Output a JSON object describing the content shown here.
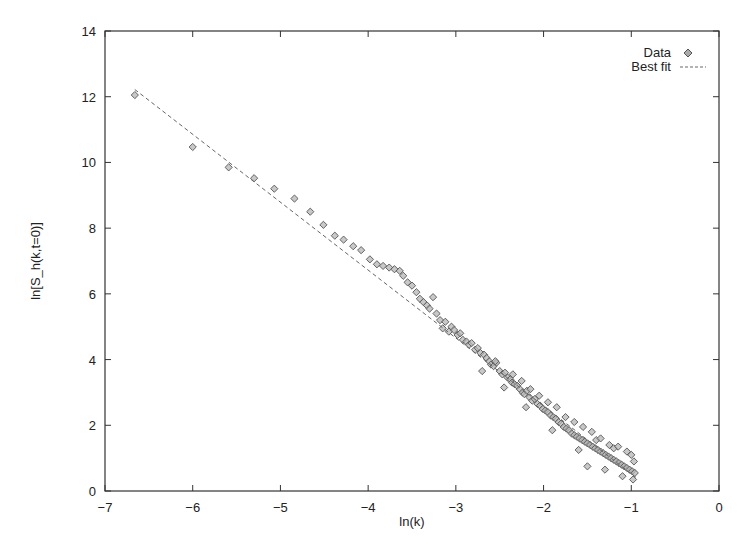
{
  "chart_data": {
    "type": "scatter",
    "title": "",
    "xlabel": "ln(k)",
    "ylabel": "ln[S_h(k,t=0)]",
    "xlim": [
      -7,
      0
    ],
    "ylim": [
      0,
      14
    ],
    "xticks": [
      -7,
      -6,
      -5,
      -4,
      -3,
      -2,
      -1,
      0
    ],
    "yticks": [
      0,
      2,
      4,
      6,
      8,
      10,
      12,
      14
    ],
    "grid": false,
    "legend_position": "top-right",
    "legend": [
      {
        "label": "Data",
        "style": "diamond-marker"
      },
      {
        "label": "Best fit",
        "style": "dashed-line"
      }
    ],
    "series": [
      {
        "name": "Data",
        "type": "scatter",
        "marker": "diamond",
        "color": "#888888",
        "points": [
          [
            -6.66,
            12.05
          ],
          [
            -6.0,
            10.47
          ],
          [
            -5.59,
            9.85
          ],
          [
            -5.3,
            9.52
          ],
          [
            -5.07,
            9.2
          ],
          [
            -4.84,
            8.9
          ],
          [
            -4.66,
            8.5
          ],
          [
            -4.51,
            8.1
          ],
          [
            -4.38,
            7.77
          ],
          [
            -4.28,
            7.65
          ],
          [
            -4.17,
            7.45
          ],
          [
            -4.08,
            7.33
          ],
          [
            -3.98,
            7.05
          ],
          [
            -3.9,
            6.9
          ],
          [
            -3.83,
            6.85
          ],
          [
            -3.76,
            6.8
          ],
          [
            -3.7,
            6.75
          ],
          [
            -3.64,
            6.7
          ],
          [
            -3.6,
            6.55
          ],
          [
            -3.55,
            6.35
          ],
          [
            -3.5,
            6.25
          ],
          [
            -3.45,
            6.05
          ],
          [
            -3.41,
            5.85
          ],
          [
            -3.37,
            5.75
          ],
          [
            -3.33,
            5.65
          ],
          [
            -3.3,
            5.55
          ],
          [
            -3.26,
            5.9
          ],
          [
            -3.22,
            5.4
          ],
          [
            -3.18,
            5.2
          ],
          [
            -3.15,
            4.95
          ],
          [
            -3.12,
            5.15
          ],
          [
            -3.08,
            4.85
          ],
          [
            -3.05,
            5.0
          ],
          [
            -3.02,
            4.9
          ],
          [
            -2.98,
            4.75
          ],
          [
            -2.95,
            4.8
          ],
          [
            -2.92,
            4.6
          ],
          [
            -2.88,
            4.55
          ],
          [
            -2.85,
            4.45
          ],
          [
            -2.82,
            4.5
          ],
          [
            -2.78,
            4.3
          ],
          [
            -2.75,
            4.35
          ],
          [
            -2.72,
            4.2
          ],
          [
            -2.68,
            4.15
          ],
          [
            -2.65,
            4.05
          ],
          [
            -2.62,
            3.95
          ],
          [
            -2.6,
            3.85
          ],
          [
            -2.57,
            3.8
          ],
          [
            -2.54,
            3.9
          ],
          [
            -2.5,
            3.65
          ],
          [
            -2.47,
            3.55
          ],
          [
            -2.44,
            3.6
          ],
          [
            -2.41,
            3.45
          ],
          [
            -2.38,
            3.4
          ],
          [
            -2.36,
            3.3
          ],
          [
            -2.33,
            3.25
          ],
          [
            -2.3,
            3.2
          ],
          [
            -2.27,
            3.1
          ],
          [
            -2.24,
            3.0
          ],
          [
            -2.22,
            2.95
          ],
          [
            -2.19,
            3.05
          ],
          [
            -2.16,
            2.85
          ],
          [
            -2.13,
            2.75
          ],
          [
            -2.1,
            2.8
          ],
          [
            -2.07,
            2.65
          ],
          [
            -2.04,
            2.6
          ],
          [
            -2.01,
            2.5
          ],
          [
            -1.98,
            2.45
          ],
          [
            -1.95,
            2.4
          ],
          [
            -1.92,
            2.3
          ],
          [
            -1.89,
            2.25
          ],
          [
            -1.86,
            2.2
          ],
          [
            -1.83,
            2.1
          ],
          [
            -1.8,
            2.05
          ],
          [
            -1.77,
            1.95
          ],
          [
            -1.74,
            1.9
          ],
          [
            -1.71,
            1.85
          ],
          [
            -1.68,
            1.75
          ],
          [
            -1.65,
            1.7
          ],
          [
            -1.62,
            1.65
          ],
          [
            -1.59,
            1.6
          ],
          [
            -1.56,
            1.55
          ],
          [
            -1.53,
            1.5
          ],
          [
            -1.5,
            1.45
          ],
          [
            -1.47,
            1.4
          ],
          [
            -1.44,
            1.35
          ],
          [
            -1.41,
            1.3
          ],
          [
            -1.38,
            1.25
          ],
          [
            -1.35,
            1.2
          ],
          [
            -1.32,
            1.15
          ],
          [
            -1.29,
            1.1
          ],
          [
            -1.26,
            1.05
          ],
          [
            -1.23,
            1.0
          ],
          [
            -1.2,
            0.95
          ],
          [
            -1.17,
            0.9
          ],
          [
            -1.14,
            0.85
          ],
          [
            -1.11,
            0.8
          ],
          [
            -1.08,
            0.75
          ],
          [
            -1.05,
            0.7
          ],
          [
            -1.02,
            0.65
          ],
          [
            -0.99,
            0.6
          ],
          [
            -0.96,
            0.55
          ],
          [
            -1.5,
            0.75
          ],
          [
            -1.3,
            0.65
          ],
          [
            -1.1,
            0.45
          ],
          [
            -0.98,
            0.35
          ],
          [
            -2.7,
            3.65
          ],
          [
            -2.45,
            3.15
          ],
          [
            -2.2,
            2.55
          ],
          [
            -1.9,
            1.85
          ],
          [
            -1.6,
            1.25
          ],
          [
            -1.4,
            1.55
          ],
          [
            -1.2,
            1.3
          ],
          [
            -1.0,
            1.1
          ],
          [
            -0.97,
            0.9
          ],
          [
            -1.05,
            1.2
          ],
          [
            -1.15,
            1.35
          ],
          [
            -1.25,
            1.4
          ],
          [
            -1.35,
            1.6
          ],
          [
            -1.45,
            1.8
          ],
          [
            -1.55,
            1.95
          ],
          [
            -1.65,
            2.1
          ],
          [
            -1.75,
            2.25
          ],
          [
            -1.85,
            2.55
          ],
          [
            -1.95,
            2.7
          ],
          [
            -2.05,
            2.9
          ],
          [
            -2.15,
            3.1
          ],
          [
            -2.25,
            3.35
          ],
          [
            -2.35,
            3.55
          ],
          [
            -2.55,
            3.95
          ]
        ]
      },
      {
        "name": "Best fit",
        "type": "line",
        "style": "dashed",
        "color": "#666666",
        "x": [
          -6.66,
          -0.95
        ],
        "y": [
          12.22,
          0.42
        ]
      }
    ]
  }
}
